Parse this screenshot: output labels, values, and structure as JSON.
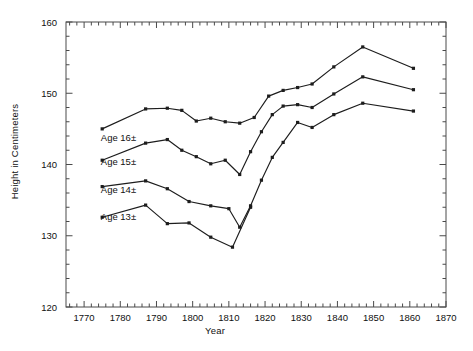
{
  "chart_data": {
    "type": "line",
    "title": "",
    "xlabel": "Year",
    "ylabel": "Height in Centimeters",
    "xlim": [
      1765,
      1870
    ],
    "ylim": [
      120,
      160
    ],
    "xticks": [
      1770,
      1780,
      1790,
      1800,
      1810,
      1820,
      1830,
      1840,
      1850,
      1860,
      1870
    ],
    "yticks": [
      120,
      130,
      140,
      150,
      160
    ],
    "xtick_labels": [
      "1770",
      "1780",
      "1790",
      "1800",
      "1810",
      "1820",
      "1830",
      "1840",
      "1850",
      "1860",
      "1870"
    ],
    "ytick_labels": [
      "120",
      "130",
      "140",
      "150",
      "160"
    ],
    "x_minor_step": 2,
    "y_minor_step": 2,
    "grid": false,
    "legend": "inline-labels",
    "series": [
      {
        "name": "Age 16±",
        "label": "Age 16±",
        "label_x": 1779.5,
        "label_y": 143.3,
        "color": "#1d1d1d",
        "points": [
          {
            "x": 1775,
            "y": 145.0
          },
          {
            "x": 1787,
            "y": 147.8
          },
          {
            "x": 1793,
            "y": 147.9
          },
          {
            "x": 1797,
            "y": 147.6
          },
          {
            "x": 1801,
            "y": 146.1
          },
          {
            "x": 1805,
            "y": 146.5
          },
          {
            "x": 1809,
            "y": 146.0
          },
          {
            "x": 1813,
            "y": 145.8
          },
          {
            "x": 1817,
            "y": 146.6
          },
          {
            "x": 1821,
            "y": 149.6
          },
          {
            "x": 1825,
            "y": 150.4
          },
          {
            "x": 1829,
            "y": 150.8
          },
          {
            "x": 1833,
            "y": 151.3
          },
          {
            "x": 1839,
            "y": 153.7
          },
          {
            "x": 1847,
            "y": 156.5
          },
          {
            "x": 1861,
            "y": 153.5
          }
        ]
      },
      {
        "name": "Age 15±",
        "label": "Age 15±",
        "label_x": 1779.5,
        "label_y": 139.9,
        "color": "#1d1d1d",
        "points": [
          {
            "x": 1775,
            "y": 140.6
          },
          {
            "x": 1787,
            "y": 143.0
          },
          {
            "x": 1793,
            "y": 143.5
          },
          {
            "x": 1797,
            "y": 142.0
          },
          {
            "x": 1801,
            "y": 141.1
          },
          {
            "x": 1805,
            "y": 140.1
          },
          {
            "x": 1809,
            "y": 140.6
          },
          {
            "x": 1813,
            "y": 138.6
          },
          {
            "x": 1816,
            "y": 141.8
          },
          {
            "x": 1819,
            "y": 144.6
          },
          {
            "x": 1822,
            "y": 147.0
          },
          {
            "x": 1825,
            "y": 148.2
          },
          {
            "x": 1829,
            "y": 148.4
          },
          {
            "x": 1833,
            "y": 148.0
          },
          {
            "x": 1839,
            "y": 149.9
          },
          {
            "x": 1847,
            "y": 152.3
          },
          {
            "x": 1861,
            "y": 150.5
          }
        ]
      },
      {
        "name": "Age 14±",
        "label": "Age 14±",
        "label_x": 1779.5,
        "label_y": 136.0,
        "color": "#1d1d1d",
        "points": [
          {
            "x": 1775,
            "y": 136.9
          },
          {
            "x": 1787,
            "y": 137.7
          },
          {
            "x": 1793,
            "y": 136.6
          },
          {
            "x": 1799,
            "y": 134.8
          },
          {
            "x": 1805,
            "y": 134.2
          },
          {
            "x": 1810,
            "y": 133.8
          },
          {
            "x": 1813,
            "y": 131.2
          },
          {
            "x": 1816,
            "y": 134.2
          },
          {
            "x": 1819,
            "y": 137.8
          },
          {
            "x": 1822,
            "y": 141.0
          },
          {
            "x": 1825,
            "y": 143.1
          },
          {
            "x": 1829,
            "y": 145.9
          },
          {
            "x": 1833,
            "y": 145.2
          },
          {
            "x": 1839,
            "y": 147.0
          },
          {
            "x": 1847,
            "y": 148.6
          },
          {
            "x": 1861,
            "y": 147.5
          }
        ]
      },
      {
        "name": "Age 13±",
        "label": "Age 13±",
        "label_x": 1779.5,
        "label_y": 132.2,
        "color": "#1d1d1d",
        "points": [
          {
            "x": 1775,
            "y": 132.6
          },
          {
            "x": 1787,
            "y": 134.3
          },
          {
            "x": 1793,
            "y": 131.7
          },
          {
            "x": 1799,
            "y": 131.8
          },
          {
            "x": 1805,
            "y": 129.8
          },
          {
            "x": 1811,
            "y": 128.4
          },
          {
            "x": 1816,
            "y": 134.0
          }
        ]
      }
    ]
  }
}
